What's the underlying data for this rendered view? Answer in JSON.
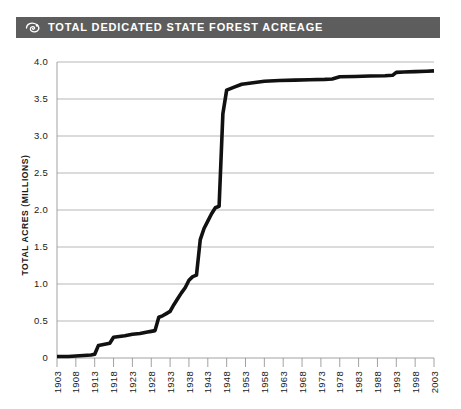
{
  "header": {
    "title": "TOTAL DEDICATED STATE FOREST ACREAGE",
    "icon": "leaf-swirl-icon",
    "bar_color": "#5d5d5d",
    "text_color": "#ffffff"
  },
  "chart_data": {
    "type": "line",
    "title": "TOTAL DEDICATED STATE FOREST ACREAGE",
    "xlabel": "",
    "ylabel": "TOTAL ACRES (MILLIONS)",
    "xlim": [
      1903,
      2003
    ],
    "ylim": [
      0,
      4.0
    ],
    "grid": true,
    "legend": "none",
    "line_color": "#111111",
    "grid_color": "#9a9a9a",
    "ytick_labels": [
      "0",
      "0.5",
      "1.0",
      "1.5",
      "2.0",
      "2.5",
      "3.0",
      "3.5",
      "4.0"
    ],
    "ytick_values": [
      0,
      0.5,
      1.0,
      1.5,
      2.0,
      2.5,
      3.0,
      3.5,
      4.0
    ],
    "xtick_labels": [
      "1903",
      "1908",
      "1913",
      "1918",
      "1923",
      "1928",
      "1933",
      "1938",
      "1943",
      "1948",
      "1953",
      "1958",
      "1963",
      "1968",
      "1973",
      "1978",
      "1983",
      "1988",
      "1993",
      "1998",
      "2003"
    ],
    "xtick_values": [
      1903,
      1908,
      1913,
      1918,
      1923,
      1928,
      1933,
      1938,
      1943,
      1948,
      1953,
      1958,
      1963,
      1968,
      1973,
      1978,
      1983,
      1988,
      1993,
      1998,
      2003
    ],
    "x": [
      1903,
      1906,
      1909,
      1912,
      1913,
      1914,
      1916,
      1917,
      1918,
      1921,
      1923,
      1925,
      1926,
      1927,
      1928,
      1929,
      1930,
      1931,
      1932,
      1933,
      1934,
      1935,
      1936,
      1937,
      1938,
      1939,
      1940,
      1941,
      1942,
      1943,
      1944,
      1945,
      1946,
      1947,
      1948,
      1950,
      1952,
      1955,
      1958,
      1962,
      1966,
      1970,
      1974,
      1976,
      1978,
      1982,
      1986,
      1990,
      1992,
      1993,
      1995,
      1998,
      2001,
      2003
    ],
    "y": [
      0.02,
      0.02,
      0.03,
      0.04,
      0.05,
      0.17,
      0.19,
      0.2,
      0.28,
      0.3,
      0.32,
      0.33,
      0.34,
      0.35,
      0.36,
      0.37,
      0.55,
      0.57,
      0.6,
      0.63,
      0.72,
      0.8,
      0.88,
      0.95,
      1.05,
      1.1,
      1.12,
      1.6,
      1.75,
      1.85,
      1.95,
      2.03,
      2.05,
      3.3,
      3.62,
      3.66,
      3.7,
      3.72,
      3.74,
      3.75,
      3.755,
      3.76,
      3.765,
      3.77,
      3.8,
      3.805,
      3.81,
      3.815,
      3.82,
      3.86,
      3.865,
      3.87,
      3.875,
      3.88
    ],
    "series": [
      {
        "name": "Total dedicated state forest acreage",
        "values": [
          0.02,
          0.02,
          0.03,
          0.04,
          0.05,
          0.17,
          0.19,
          0.2,
          0.28,
          0.3,
          0.32,
          0.33,
          0.34,
          0.35,
          0.36,
          0.37,
          0.55,
          0.57,
          0.6,
          0.63,
          0.72,
          0.8,
          0.88,
          0.95,
          1.05,
          1.1,
          1.12,
          1.6,
          1.75,
          1.85,
          1.95,
          2.03,
          2.05,
          3.3,
          3.62,
          3.66,
          3.7,
          3.72,
          3.74,
          3.75,
          3.755,
          3.76,
          3.765,
          3.77,
          3.8,
          3.805,
          3.81,
          3.815,
          3.82,
          3.86,
          3.865,
          3.87,
          3.875,
          3.88
        ]
      }
    ]
  }
}
